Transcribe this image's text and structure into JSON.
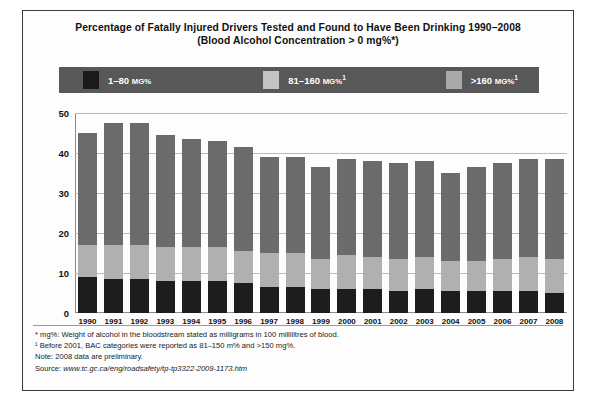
{
  "chart_data": {
    "type": "bar",
    "title": "Percentage of Fatally Injured Drivers Tested and Found to Have Been Drinking 1990–2008 (Blood Alcohol Concentration > 0 mg%*)",
    "title_line1": "Percentage of Fatally Injured Drivers Tested and Found to Have Been Drinking 1990–2008",
    "title_line2": "(Blood Alcohol Concentration > 0 mg%*)",
    "xlabel": "",
    "ylabel": "",
    "ylim": [
      0,
      50
    ],
    "yticks": [
      0,
      10,
      20,
      30,
      40,
      50
    ],
    "grid": true,
    "stacked": true,
    "legend_position": "top",
    "categories": [
      "1990",
      "1991",
      "1992",
      "1993",
      "1994",
      "1995",
      "1996",
      "1997",
      "1998",
      "1999",
      "2000",
      "2001",
      "2002",
      "2003",
      "2004",
      "2005",
      "2006",
      "2007",
      "2008"
    ],
    "series": [
      {
        "name": "1–80 mg%",
        "color": "#1d1d1d",
        "values": [
          9.0,
          8.5,
          8.5,
          8.0,
          8.0,
          8.0,
          7.5,
          6.5,
          6.5,
          6.0,
          6.0,
          6.0,
          5.5,
          6.0,
          5.5,
          5.5,
          5.5,
          5.5,
          5.0
        ]
      },
      {
        "name": "81–160 mg%",
        "color": "#b0b0b0",
        "values": [
          8.0,
          8.5,
          8.5,
          8.5,
          8.5,
          8.5,
          8.0,
          8.5,
          8.5,
          7.5,
          8.5,
          8.0,
          8.0,
          8.0,
          7.5,
          7.5,
          8.0,
          8.5,
          8.5
        ]
      },
      {
        "name": ">160 mg%",
        "color": "#6b6b6b",
        "values": [
          28.0,
          30.5,
          30.5,
          28.0,
          27.0,
          26.5,
          26.0,
          24.0,
          24.0,
          23.0,
          24.0,
          24.0,
          24.0,
          24.0,
          22.0,
          23.5,
          24.0,
          24.5,
          25.0
        ]
      }
    ],
    "totals": [
      45.0,
      47.5,
      47.5,
      44.5,
      43.5,
      43.0,
      41.5,
      39.0,
      39.0,
      36.5,
      38.5,
      38.0,
      37.5,
      38.0,
      35.0,
      36.5,
      37.5,
      38.5,
      38.5
    ]
  },
  "legend": {
    "background_color": "#585858",
    "items": [
      {
        "label_main": "1–80",
        "label_unit": "MG%",
        "sup": "",
        "swatch": "legend-swatch-dark"
      },
      {
        "label_main": "81–160",
        "label_unit": "MG%",
        "sup": "1",
        "swatch": "legend-swatch-mid"
      },
      {
        "label_main": ">160",
        "label_unit": "MG%",
        "sup": "1",
        "swatch": "legend-swatch-light"
      }
    ]
  },
  "notes": {
    "footnote_star": "* mg%: Weight of alcohol in the bloodstream stated as milligrams in 100 millilitres of blood.",
    "footnote_one": "¹ Before 2001, BAC categories were reported as 81–150 m% and >150 mg%.",
    "note": "Note: 2008 data are preliminary.",
    "source_prefix": "Source: ",
    "source_url": "www.tc.gc.ca/eng/roadsafety/tp-tp3322-2009-1173.htm"
  }
}
